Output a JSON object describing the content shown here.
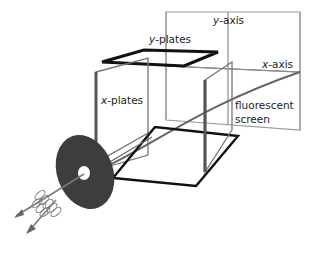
{
  "diagram": {
    "type": "cathode-ray-tube-schematic",
    "labels": {
      "y_plates": {
        "var": "y",
        "rest": "-plates"
      },
      "x_plates": {
        "var": "x",
        "rest": "-plates"
      },
      "y_axis": {
        "var": "y",
        "rest": "-axis"
      },
      "x_axis": {
        "var": "x",
        "rest": "-axis"
      },
      "screen_line1": "fluorescent",
      "screen_line2": "screen"
    },
    "colors": {
      "background": "#ffffff",
      "plate_dark": "#111111",
      "plate_gray": "#555555",
      "frame": "#999999",
      "beam": "#666666",
      "disc": "#3d3d3d",
      "text": "#222222"
    }
  }
}
